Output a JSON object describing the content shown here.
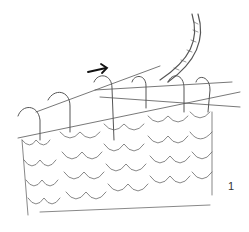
{
  "figure": {
    "step_number": "1",
    "direction_arrow": "right",
    "stitch_count_on_needle": 6,
    "colors": {
      "line": "#4a4a4a",
      "fill": "#ffffff",
      "arrow": "#111111"
    }
  }
}
